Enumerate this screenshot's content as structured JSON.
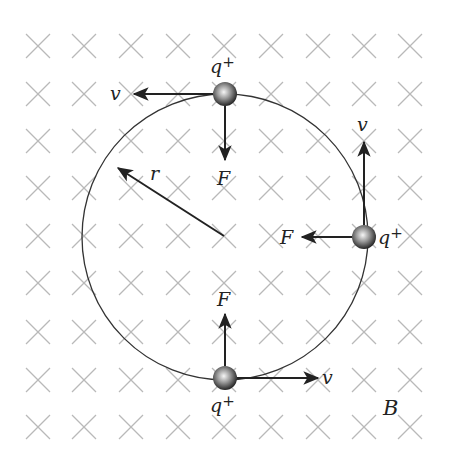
{
  "figure": {
    "field": {
      "label": "B",
      "direction": "into-page",
      "symbol": "cross-mark",
      "grid_columns": [
        38,
        84,
        131,
        178,
        224,
        271,
        318,
        364,
        410
      ],
      "grid_rows": [
        46,
        94,
        141,
        188,
        236,
        283,
        332,
        380,
        427
      ],
      "color": "#b9b9b9"
    },
    "orbit": {
      "center": [
        225,
        237
      ],
      "radius": 143,
      "radius_label": "r",
      "color": "#333333"
    },
    "charges": [
      {
        "name": "top",
        "position": [
          225,
          94
        ],
        "charge_label": "q",
        "charge_sign": "+",
        "velocity_label": "v",
        "velocity_direction": "left",
        "force_label": "F",
        "force_direction": "down"
      },
      {
        "name": "right",
        "position": [
          364,
          237
        ],
        "charge_label": "q",
        "charge_sign": "+",
        "velocity_label": "v",
        "velocity_direction": "up",
        "force_label": "F",
        "force_direction": "left"
      },
      {
        "name": "bottom",
        "position": [
          225,
          380
        ],
        "charge_label": "q",
        "charge_sign": "+",
        "velocity_label": "v",
        "velocity_direction": "right",
        "force_label": "F",
        "force_direction": "up"
      }
    ],
    "colors": {
      "arrow": "#222222",
      "charge_highlight": "#f4f4f4",
      "charge_shadow": "#222222"
    }
  }
}
